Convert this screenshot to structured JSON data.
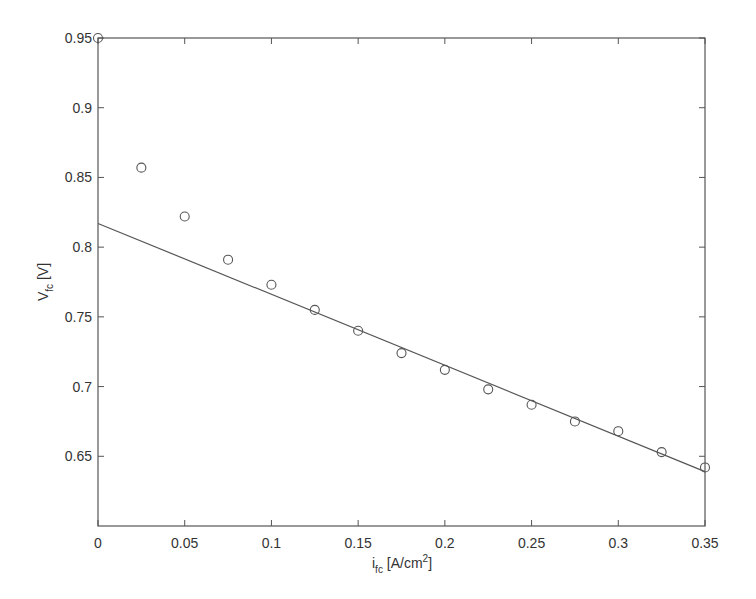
{
  "chart_data": {
    "type": "scatter",
    "title": "",
    "xlabel": "i_fc [A/cm^2]",
    "ylabel": "V_fc [V]",
    "xlabel_parts": {
      "main": "i",
      "sub": "fc",
      "rest": " [A/cm",
      "sup": "2",
      "end": "]"
    },
    "ylabel_parts": {
      "main": "V",
      "sub": "fc",
      "rest": " [V]"
    },
    "xlim": [
      0,
      0.35
    ],
    "ylim": [
      0.6,
      0.95
    ],
    "xticks": [
      0,
      0.05,
      0.1,
      0.15,
      0.2,
      0.25,
      0.3,
      0.35
    ],
    "xtick_labels": [
      "0",
      "0.05",
      "0.1",
      "0.15",
      "0.2",
      "0.25",
      "0.3",
      "0.35"
    ],
    "yticks": [
      0.65,
      0.7,
      0.75,
      0.8,
      0.85,
      0.9,
      0.95
    ],
    "ytick_labels": [
      "0.65",
      "0.7",
      "0.75",
      "0.8",
      "0.85",
      "0.9",
      "0.95"
    ],
    "grid": false,
    "legend": null,
    "series": [
      {
        "name": "measured",
        "type": "scatter",
        "marker": "circle-open",
        "x": [
          0,
          0.025,
          0.05,
          0.075,
          0.1,
          0.125,
          0.15,
          0.175,
          0.2,
          0.225,
          0.25,
          0.275,
          0.3,
          0.325,
          0.35
        ],
        "y": [
          0.95,
          0.857,
          0.822,
          0.791,
          0.773,
          0.755,
          0.74,
          0.724,
          0.712,
          0.698,
          0.687,
          0.675,
          0.668,
          0.653,
          0.642
        ]
      },
      {
        "name": "linear fit",
        "type": "line",
        "x": [
          0,
          0.35
        ],
        "y": [
          0.817,
          0.639
        ]
      }
    ],
    "colors": {
      "axis": "#555555",
      "line": "#555555",
      "marker": "#555555",
      "text": "#333333"
    }
  }
}
